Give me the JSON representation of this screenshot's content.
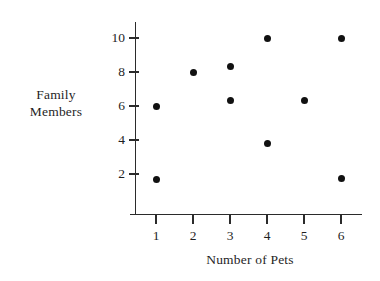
{
  "chart_data": {
    "type": "scatter",
    "title": "",
    "xlabel": "Number of Pets",
    "ylabel": "Family Members",
    "ylabel_lines": [
      "Family",
      "Members"
    ],
    "xticks": [
      1,
      2,
      3,
      4,
      5,
      6
    ],
    "xtick_labels": [
      "1",
      "2",
      "3",
      "4",
      "5",
      "6"
    ],
    "yticks": [
      2,
      4,
      6,
      8,
      10
    ],
    "ytick_labels": [
      "2",
      "4",
      "6",
      "8",
      "10"
    ],
    "xlim": [
      0.3,
      6.7
    ],
    "ylim": [
      0.3,
      11.3
    ],
    "grid": false,
    "legend": null,
    "marker": "filled-circle",
    "marker_color": "#111111",
    "axis_color": "#2b2b2b",
    "background": "#ffffff",
    "points": [
      {
        "x": 1,
        "y": 6.0
      },
      {
        "x": 1,
        "y": 1.7
      },
      {
        "x": 2,
        "y": 8.0
      },
      {
        "x": 3,
        "y": 8.35
      },
      {
        "x": 3,
        "y": 6.3
      },
      {
        "x": 4,
        "y": 10.0
      },
      {
        "x": 4,
        "y": 3.8
      },
      {
        "x": 5,
        "y": 6.3
      },
      {
        "x": 6,
        "y": 10.0
      },
      {
        "x": 6,
        "y": 1.75
      }
    ]
  }
}
